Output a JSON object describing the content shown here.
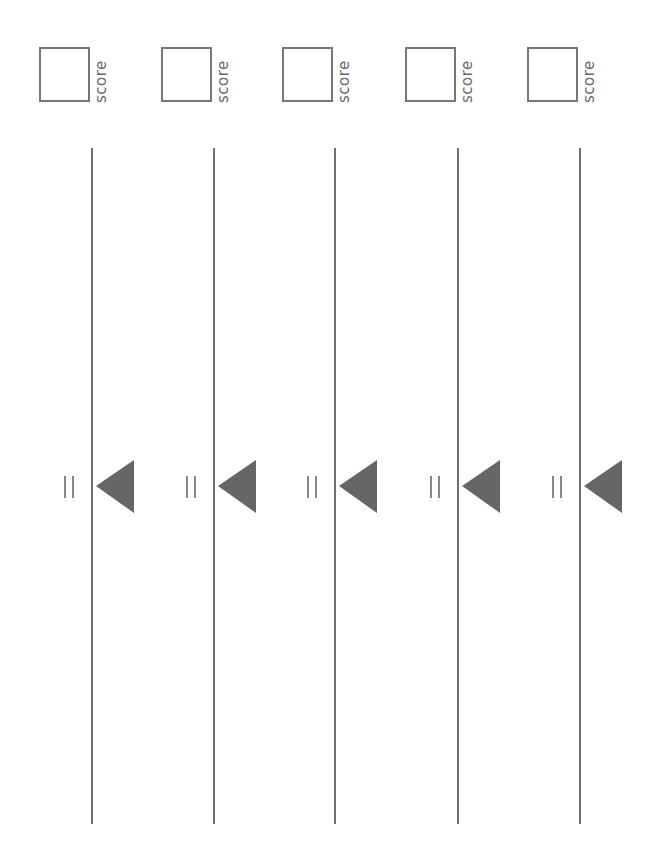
{
  "worksheet": {
    "orientation": "rotated-90",
    "colors": {
      "line": "#707070",
      "marker": "#666666",
      "box_border": "#777777",
      "text": "#6a6a6a"
    },
    "columns": [
      {
        "score_label": "score",
        "score_value": "",
        "equals_symbol": "=",
        "marker_icon": "triangle-left-icon"
      },
      {
        "score_label": "score",
        "score_value": "",
        "equals_symbol": "=",
        "marker_icon": "triangle-left-icon"
      },
      {
        "score_label": "score",
        "score_value": "",
        "equals_symbol": "=",
        "marker_icon": "triangle-left-icon"
      },
      {
        "score_label": "score",
        "score_value": "",
        "equals_symbol": "=",
        "marker_icon": "triangle-left-icon"
      },
      {
        "score_label": "score",
        "score_value": "",
        "equals_symbol": "=",
        "marker_icon": "triangle-left-icon"
      }
    ]
  }
}
